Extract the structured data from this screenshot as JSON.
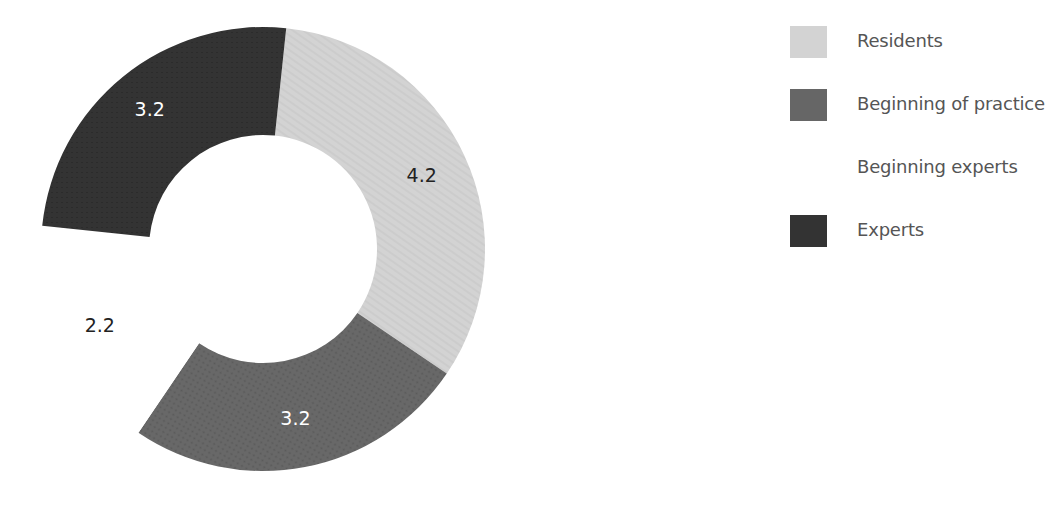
{
  "chart_data": {
    "type": "pie",
    "variant": "donut",
    "title": "",
    "categories": [
      "Residents",
      "Beginning of practice",
      "Beginning experts",
      "Experts"
    ],
    "values": [
      4.2,
      3.2,
      2.2,
      3.2
    ],
    "labels": [
      "4.2",
      "3.2",
      "2.2",
      "3.2"
    ],
    "colors": [
      "#d3d3d3",
      "#666666",
      "#ffffff",
      "#333333"
    ],
    "label_colors": [
      "#222222",
      "#ffffff",
      "#222222",
      "#ffffff"
    ],
    "start_angle_deg": 6,
    "direction": "clockwise",
    "legend_position": "right"
  },
  "legend": {
    "items": [
      {
        "label": "Residents",
        "color": "#d3d3d3"
      },
      {
        "label": "Beginning of practice",
        "color": "#666666"
      },
      {
        "label": "Beginning experts",
        "color": "#ffffff"
      },
      {
        "label": "Experts",
        "color": "#333333"
      }
    ]
  }
}
